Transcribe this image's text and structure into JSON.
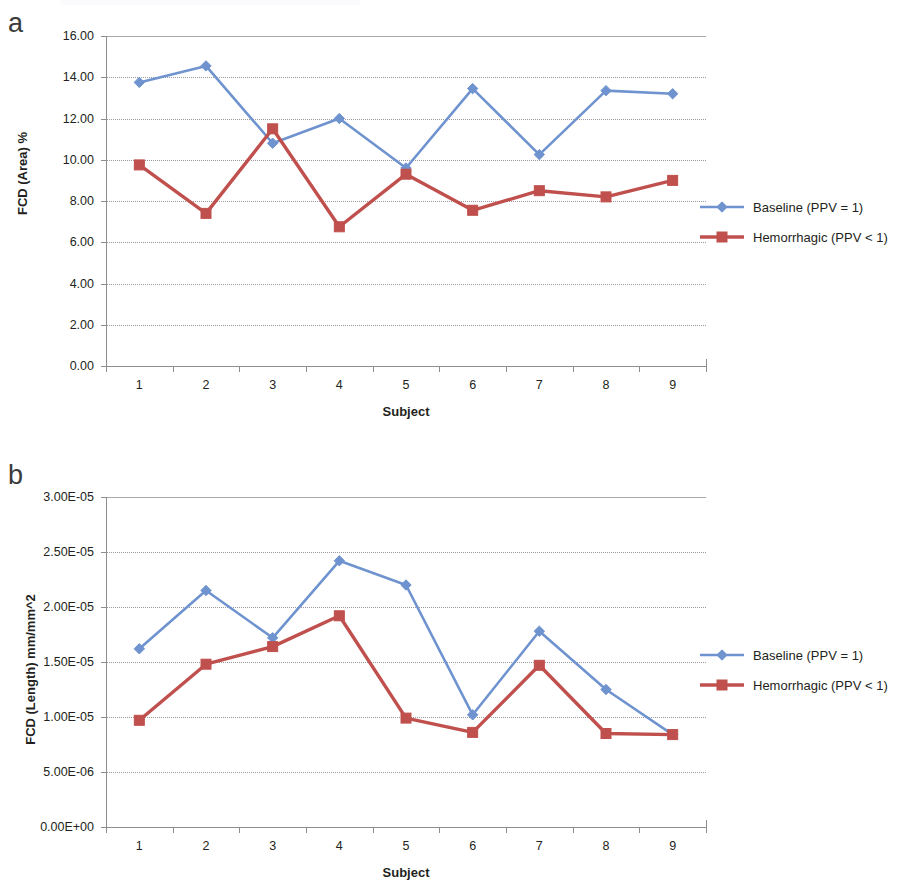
{
  "figure": {
    "panels": [
      {
        "letter": "a",
        "ylabel": "FCD (Area) %",
        "xlabel": "Subject",
        "ytick_labels": [
          "0.00",
          "2.00",
          "4.00",
          "6.00",
          "8.00",
          "10.00",
          "12.00",
          "14.00",
          "16.00"
        ],
        "xtick_labels": [
          "1",
          "2",
          "3",
          "4",
          "5",
          "6",
          "7",
          "8",
          "9"
        ],
        "legend": [
          {
            "label": "Baseline (PPV = 1)",
            "color": "#6f93cf",
            "marker": "diamond"
          },
          {
            "label": "Hemorrhagic (PPV < 1)",
            "color": "#c0504d",
            "marker": "square"
          }
        ]
      },
      {
        "letter": "b",
        "ylabel": "FCD (Length) mm/mm^2",
        "xlabel": "Subject",
        "ytick_labels": [
          "0.00E+00",
          "5.00E-06",
          "1.00E-05",
          "1.50E-05",
          "2.00E-05",
          "2.50E-05",
          "3.00E-05"
        ],
        "xtick_labels": [
          "1",
          "2",
          "3",
          "4",
          "5",
          "6",
          "7",
          "8",
          "9"
        ],
        "legend": [
          {
            "label": "Baseline (PPV = 1)",
            "color": "#6f93cf",
            "marker": "diamond"
          },
          {
            "label": "Hemorrhagic (PPV < 1)",
            "color": "#c0504d",
            "marker": "square"
          }
        ]
      }
    ]
  },
  "chart_data": [
    {
      "type": "line",
      "panel": "a",
      "title": "",
      "xlabel": "Subject",
      "ylabel": "FCD (Area) %",
      "categories": [
        "1",
        "2",
        "3",
        "4",
        "5",
        "6",
        "7",
        "8",
        "9"
      ],
      "x": [
        1,
        2,
        3,
        4,
        5,
        6,
        7,
        8,
        9
      ],
      "ylim": [
        0.0,
        16.0
      ],
      "ytick_values": [
        0.0,
        2.0,
        4.0,
        6.0,
        8.0,
        10.0,
        12.0,
        14.0,
        16.0
      ],
      "grid": "horizontal",
      "legend_position": "right",
      "series": [
        {
          "name": "Baseline (PPV = 1)",
          "color": "#6f93cf",
          "marker": "diamond",
          "values": [
            13.75,
            14.55,
            10.8,
            12.0,
            9.6,
            13.45,
            10.25,
            13.35,
            13.2
          ]
        },
        {
          "name": "Hemorrhagic (PPV < 1)",
          "color": "#c0504d",
          "marker": "square",
          "values": [
            9.75,
            7.4,
            11.5,
            6.75,
            9.3,
            7.55,
            8.5,
            8.2,
            9.0
          ]
        }
      ]
    },
    {
      "type": "line",
      "panel": "b",
      "title": "",
      "xlabel": "Subject",
      "ylabel": "FCD (Length) mm/mm^2",
      "categories": [
        "1",
        "2",
        "3",
        "4",
        "5",
        "6",
        "7",
        "8",
        "9"
      ],
      "x": [
        1,
        2,
        3,
        4,
        5,
        6,
        7,
        8,
        9
      ],
      "ylim": [
        0.0,
        3e-05
      ],
      "ytick_values": [
        0.0,
        5e-06,
        1e-05,
        1.5e-05,
        2e-05,
        2.5e-05,
        3e-05
      ],
      "grid": "horizontal",
      "legend_position": "right",
      "series": [
        {
          "name": "Baseline (PPV = 1)",
          "color": "#6f93cf",
          "marker": "diamond",
          "values": [
            1.62e-05,
            2.15e-05,
            1.72e-05,
            2.42e-05,
            2.2e-05,
            1.02e-05,
            1.78e-05,
            1.25e-05,
            8.4e-06
          ]
        },
        {
          "name": "Hemorrhagic (PPV < 1)",
          "color": "#c0504d",
          "marker": "square",
          "values": [
            9.7e-06,
            1.48e-05,
            1.64e-05,
            1.92e-05,
            9.9e-06,
            8.6e-06,
            1.47e-05,
            8.5e-06,
            8.4e-06
          ]
        }
      ]
    }
  ]
}
